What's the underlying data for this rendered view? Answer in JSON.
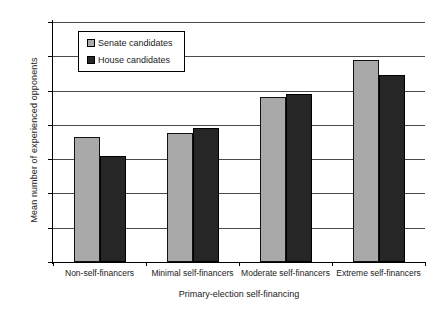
{
  "chart_data": {
    "type": "bar",
    "title": "",
    "xlabel": "Primary-election self-financing",
    "ylabel": "Mean number of experienced opponents",
    "categories": [
      "Non-self-financers",
      "Minimal self-financers",
      "Moderate self-financers",
      "Extreme self-financers"
    ],
    "series": [
      {
        "name": "Senate candidates",
        "color": "#a9a9a9",
        "values": [
          0.73,
          0.75,
          0.96,
          1.18
        ]
      },
      {
        "name": "House candidates",
        "color": "#262626",
        "values": [
          0.62,
          0.78,
          0.98,
          1.09
        ]
      }
    ],
    "ylim": [
      0,
      1.4
    ],
    "ytick_values": [
      0,
      0.2,
      0.4,
      0.6,
      0.8,
      1,
      1.2,
      1.4
    ],
    "ytick_labels": [
      "0",
      "0.2",
      "0.4",
      "0.6",
      "0.8",
      "1",
      "1.2",
      "1.4"
    ],
    "grid": true,
    "legend_position": "upper-left-inside"
  }
}
